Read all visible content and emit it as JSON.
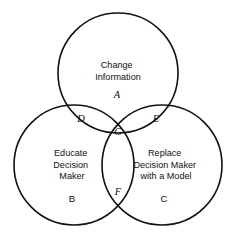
{
  "figure": {
    "type": "venn-diagram",
    "background_color": "#ffffff",
    "stroke_color": "#121212",
    "text_color": "#111111",
    "width": 237,
    "height": 241
  },
  "sets": [
    {
      "id": "A",
      "label": "A",
      "title_lines": [
        "Change",
        "Information"
      ],
      "title_line_1": "Change",
      "title_line_2": "Information",
      "position": "top",
      "cx": 118,
      "cy": 73,
      "r": 60
    },
    {
      "id": "B",
      "label": "B",
      "title_lines": [
        "Educate",
        "Decision",
        "Maker"
      ],
      "title_line_1": "Educate",
      "title_line_2": "Decision",
      "title_line_3": "Maker",
      "position": "bottom-left",
      "cx": 74,
      "cy": 165,
      "r": 60
    },
    {
      "id": "C",
      "label": "C",
      "title_lines": [
        "Replace",
        "Decision Maker",
        "with a Model"
      ],
      "title_line_1": "Replace",
      "title_line_2": "Decision Maker",
      "title_line_3": "with a Model",
      "position": "bottom-right",
      "cx": 162,
      "cy": 165,
      "r": 60
    }
  ],
  "regions": [
    {
      "id": "A",
      "label": "A",
      "description": "change-information-only",
      "style": "italic",
      "x": 117,
      "y": 98
    },
    {
      "id": "B",
      "label": "B",
      "description": "educate-decision-maker-only",
      "style": "upright",
      "x": 72,
      "y": 202
    },
    {
      "id": "C",
      "label": "C",
      "description": "replace-decision-maker-only",
      "style": "upright",
      "x": 164,
      "y": 202
    },
    {
      "id": "D",
      "label": "D",
      "description": "change-information-and-educate",
      "style": "italic",
      "x": 81,
      "y": 122
    },
    {
      "id": "E",
      "label": "E",
      "description": "change-information-and-replace",
      "style": "italic",
      "x": 156,
      "y": 122
    },
    {
      "id": "F",
      "label": "F",
      "description": "educate-and-replace",
      "style": "italic",
      "x": 118,
      "y": 195
    },
    {
      "id": "G",
      "label": "G",
      "description": "all-three-sets",
      "style": "italic",
      "x": 118,
      "y": 135
    }
  ]
}
